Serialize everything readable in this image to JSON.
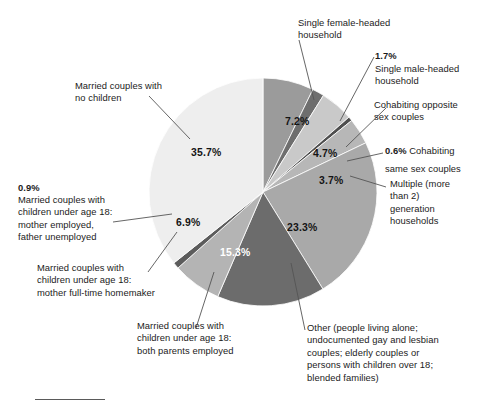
{
  "chart_data": {
    "type": "pie",
    "title": "",
    "subtitle": "",
    "xlabel": "",
    "ylabel": "",
    "legend_position": "callout-labels",
    "grid": false,
    "units": "percent",
    "start_angle_deg": 0,
    "direction": "clockwise",
    "categories": [
      "Single female-headed household",
      "Single male-headed household",
      "Cohabiting opposite sex couples",
      "Cohabiting same sex couples",
      "Multiple (more than 2) generation households",
      "Other (people living alone; undocumented gay and lesbian couples; elderly couples or persons with children over 18; blended families)",
      "Married couples with children under age 18: both parents employed",
      "Married couples with children under age 18: mother full-time homemaker",
      "Married couples with children under age 18: mother employed, father unemployed",
      "Married couples with no children"
    ],
    "values": [
      7.2,
      1.7,
      4.7,
      0.6,
      3.7,
      23.3,
      15.3,
      6.9,
      0.9,
      35.7
    ],
    "value_labels": [
      "7.2%",
      "1.7%",
      "4.7%",
      "0.6%",
      "3.7%",
      "23.3%",
      "15.3%",
      "6.9%",
      "0.9%",
      "35.7%"
    ],
    "colors": [
      "#9b9b9b",
      "#6e6e6e",
      "#c9c9c9",
      "#4f4f4f",
      "#b7b7b7",
      "#a9a9a9",
      "#6c6c6c",
      "#b4b4b4",
      "#5c5c5c",
      "#eeeeee"
    ],
    "slices": [
      {
        "label": "Single female-headed household",
        "value": 7.2,
        "value_label": "7.2%",
        "color": "#9b9b9b"
      },
      {
        "label": "Single male-headed household",
        "value": 1.7,
        "value_label": "1.7%",
        "color": "#6e6e6e"
      },
      {
        "label": "Cohabiting opposite sex couples",
        "value": 4.7,
        "value_label": "4.7%",
        "color": "#c9c9c9"
      },
      {
        "label": "Cohabiting same sex couples",
        "value": 0.6,
        "value_label": "0.6%",
        "color": "#4f4f4f"
      },
      {
        "label": "Multiple (more than 2) generation households",
        "value": 3.7,
        "value_label": "3.7%",
        "color": "#b7b7b7"
      },
      {
        "label": "Other (people living alone; undocumented gay and lesbian couples; elderly couples or persons with children over 18; blended families)",
        "value": 23.3,
        "value_label": "23.3%",
        "color": "#a9a9a9"
      },
      {
        "label": "Married couples with children under age 18: both parents employed",
        "value": 15.3,
        "value_label": "15.3%",
        "color": "#6c6c6c"
      },
      {
        "label": "Married couples with children under age 18: mother full-time homemaker",
        "value": 6.9,
        "value_label": "6.9%",
        "color": "#b4b4b4"
      },
      {
        "label": "Married couples with children under age 18: mother employed, father unemployed",
        "value": 0.9,
        "value_label": "0.9%",
        "color": "#5c5c5c"
      },
      {
        "label": "Married couples with no children",
        "value": 35.7,
        "value_label": "35.7%",
        "color": "#eeeeee"
      }
    ]
  },
  "callouts": {
    "single_female": "Single female-headed\nhousehold",
    "single_male_pct": "1.7%",
    "single_male": "Single male-headed\nhousehold",
    "cohab_opposite": "Cohabiting opposite\nsex couples",
    "cohab_same_pct": "0.6%",
    "cohab_same": " Cohabiting\nsame sex couples",
    "multiple_gen": "Multiple (more\nthan 2)\ngeneration\nhouseholds",
    "other": "Other (people living alone;\nundocumented gay and lesbian\ncouples; elderly couples or\npersons with children over 18;\nblended families)",
    "both_employed": "Married couples with\nchildren under age 18:\nboth parents employed",
    "homemaker": "Married couples with\nchildren under age 18:\nmother full-time homemaker",
    "father_unemployed_pct": "0.9%",
    "father_unemployed": "Married couples with\nchildren under age 18:\nmother employed,\nfather unemployed",
    "no_children": "Married couples with\nno children"
  },
  "slice_value_positions": {
    "p35_7": "35.7%",
    "p7_2": "7.2%",
    "p4_7": "4.7%",
    "p3_7": "3.7%",
    "p23_3": "23.3%",
    "p15_3": "15.3%",
    "p6_9": "6.9%"
  }
}
